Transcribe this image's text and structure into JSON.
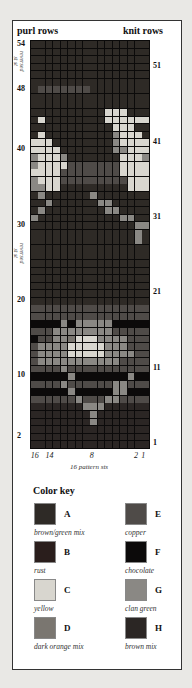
{
  "header": {
    "left": "purl rows",
    "right": "knit rows"
  },
  "side_note": {
    "text": "reversed\nst st"
  },
  "left_labels": [
    {
      "text": "54",
      "row": 54
    },
    {
      "text": "48",
      "row": 48
    },
    {
      "text": "40",
      "row": 40
    },
    {
      "text": "30",
      "row": 30
    },
    {
      "text": "20",
      "row": 20
    },
    {
      "text": "10",
      "row": 10
    },
    {
      "text": "2",
      "row": 2
    }
  ],
  "right_labels": [
    {
      "text": "51",
      "row": 51
    },
    {
      "text": "41",
      "row": 41
    },
    {
      "text": "31",
      "row": 31
    },
    {
      "text": "21",
      "row": 21
    },
    {
      "text": "11",
      "row": 11
    },
    {
      "text": "1",
      "row": 1
    }
  ],
  "x_ticks": [
    {
      "text": "16",
      "col": 16
    },
    {
      "text": "14",
      "col": 14
    },
    {
      "text": "8",
      "col": 8
    },
    {
      "text": "2",
      "col": 2
    },
    {
      "text": "1",
      "col": 1
    }
  ],
  "x_caption": "16 pattern sts",
  "color_key": {
    "title": "Color key",
    "items": [
      {
        "code": "A",
        "name": "brown/green mix",
        "color": "#2e2a26"
      },
      {
        "code": "B",
        "name": "rust",
        "color": "#2a1e1c"
      },
      {
        "code": "C",
        "name": "yellow",
        "color": "#d8d6cf"
      },
      {
        "code": "D",
        "name": "dark orange mix",
        "color": "#7a7670"
      },
      {
        "code": "E",
        "name": "copper",
        "color": "#4f4b48"
      },
      {
        "code": "F",
        "name": "chocolate",
        "color": "#0c0a0a"
      },
      {
        "code": "G",
        "name": "clan green",
        "color": "#8a8884"
      },
      {
        "code": "H",
        "name": "brown mix",
        "color": "#2b2624"
      }
    ]
  },
  "chart_data": {
    "type": "heatmap",
    "columns": 16,
    "rows": 54,
    "xlabel": "16 pattern sts",
    "row_order": "top-to-bottom, row 54 first",
    "col_order": "left-to-right, stitch 16 first",
    "legend": {
      "A": "brown/green mix",
      "B": "rust",
      "C": "yellow",
      "D": "dark orange mix",
      "E": "copper",
      "F": "chocolate",
      "G": "clan green",
      "H": "brown mix"
    },
    "grid": [
      "AAAAAAAAAAAAAAAA",
      "AAAAAAAAAAAAAAAA",
      "AAAAAAAAAAAAAAAA",
      "AAAAAAAAAAAAAAAA",
      "AAAAAAAAAAAAAAAA",
      "AAAAAAAAAAAAAAAA",
      "AEEEEEEEAAAAAAAA",
      "AAAAAAAAAAAAAAAA",
      "AAAAAAAAAAAAAAAA",
      "AAAAAAAAAACCCAAA",
      "ACAAAAAAAACCCCCC",
      "AAAAAAAAAAACCCAA",
      "ACAAAAAAAAAGCCCA",
      "CCCAAAAAAAAGCCCC",
      "CCCCAAAAAAAGGCCC",
      "GCCCGAAAAAAACCCG",
      "GCCCCEEEEEEECCCC",
      "CCCCEEEEEEEECCCC",
      "GCCCEEEEEEEEECCC",
      "GGCCAAAAAAAAACCC",
      "AGAAAAAAGAAAAAAA",
      "AAGAAAAAAGGAAAAA",
      "AGAAAAAAAAGGAAAA",
      "GAAAAAAAAAAAGGAA",
      "AAAAAAAAAAAAAAGG",
      "AAAAAAAAAAAAAAGA",
      "AAAAAAAAAAAAAAGA",
      "AAAAAAAAAAAAAAAA",
      "AAAAAAAAAAAAAAAA",
      "AAAAAAAAAAAAAAAA",
      "AAAAAAAAAAAAAAAA",
      "AAAAAAAAAAAAAAAA",
      "AAAAAAAAAAAAAAAA",
      "AAAAAAAAAAAAAAAA",
      "AAAAAAAAAAAAAAAA",
      "EEEEEEEEEEEEEEEE",
      "EEEEEEEEEEEEEEEE",
      "FFFFGFGGGGGFFFFF",
      "EEEGGGGGGGGEEEEE",
      "FEEGGDCCCGGGGEEE",
      "EGGGGCCCCCGGGEEE",
      "EGGGGCCCCCGGGGEE",
      "EGGGGGGGGGGGEEEE",
      "EEEEGEEEEEEEEEEE",
      "FFFFFGFFFFFFFGFF",
      "EEEEGEEEEEEGGEEE",
      "FFFFFGFFFFFGGFFF",
      "EEEEEEGEEEGGEEEE",
      "HHHHHHHGGGHHHHHH",
      "HHHHHHHHGHHHHHHH",
      "HHHHHHHHGHHHHHHH",
      "HHHHHHHHHHHHHHHH",
      "HHHHHHHHHHHHHHHH",
      "HHHHHHHHHHHHHHHH"
    ]
  }
}
